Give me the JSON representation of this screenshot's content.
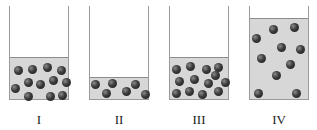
{
  "diagram": {
    "containers": [
      {
        "label": "I",
        "left": 9,
        "fill_height": 41,
        "particle_count": 12,
        "particles": [
          [
            8,
            10
          ],
          [
            22,
            9
          ],
          [
            37,
            7
          ],
          [
            51,
            10
          ],
          [
            18,
            22
          ],
          [
            30,
            24
          ],
          [
            43,
            20
          ],
          [
            56,
            22
          ],
          [
            5,
            28
          ],
          [
            18,
            36
          ],
          [
            40,
            36
          ],
          [
            52,
            35
          ]
        ]
      },
      {
        "label": "II",
        "left": 89,
        "fill_height": 21,
        "particle_count": 6,
        "particles": [
          [
            5,
            4
          ],
          [
            22,
            3
          ],
          [
            45,
            4
          ],
          [
            16,
            13
          ],
          [
            36,
            11
          ],
          [
            55,
            14
          ]
        ]
      },
      {
        "label": "III",
        "left": 169,
        "fill_height": 41,
        "particle_count": 13,
        "particles": [
          [
            6,
            9
          ],
          [
            20,
            6
          ],
          [
            36,
            9
          ],
          [
            48,
            7
          ],
          [
            9,
            21
          ],
          [
            24,
            19
          ],
          [
            38,
            23
          ],
          [
            45,
            15
          ],
          [
            55,
            22
          ],
          [
            6,
            33
          ],
          [
            19,
            31
          ],
          [
            32,
            34
          ],
          [
            48,
            31
          ]
        ]
      },
      {
        "label": "IV",
        "left": 249,
        "fill_height": 80,
        "particle_count": 10,
        "particles": [
          [
            6,
            17
          ],
          [
            23,
            8
          ],
          [
            44,
            6
          ],
          [
            31,
            26
          ],
          [
            50,
            28
          ],
          [
            11,
            37
          ],
          [
            40,
            43
          ],
          [
            26,
            54
          ],
          [
            8,
            72
          ],
          [
            46,
            72
          ]
        ]
      }
    ]
  }
}
